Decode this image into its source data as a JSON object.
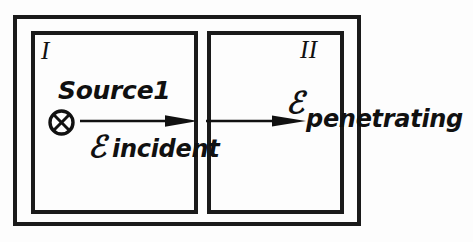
{
  "figure": {
    "type": "physics-schematic",
    "background_color": "#fdfdfd",
    "ink_color": "#1a1a1a"
  },
  "regions": {
    "one": {
      "label": "I",
      "source_label": "Source1",
      "source_icon": "circled-x-icon"
    },
    "two": {
      "label": "II"
    }
  },
  "fields": {
    "incident": {
      "symbol": "ℰ",
      "subscript": "incident",
      "arrow_icon": "arrow-right-icon"
    },
    "penetrating": {
      "symbol": "ℰ",
      "subscript": "penetrating",
      "arrow_icon": "arrow-right-icon"
    }
  }
}
